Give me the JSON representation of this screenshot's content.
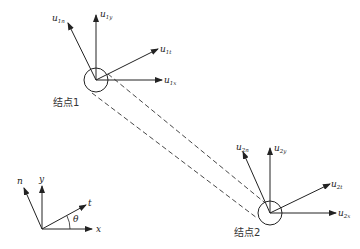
{
  "diagram": {
    "node1": {
      "label": "结点1",
      "vectors": {
        "n": {
          "base": "u",
          "sub": "1n"
        },
        "y": {
          "base": "u",
          "sub": "1y"
        },
        "t": {
          "base": "u",
          "sub": "1t"
        },
        "x": {
          "base": "u",
          "sub": "1x"
        }
      }
    },
    "node2": {
      "label": "结点2",
      "vectors": {
        "n": {
          "base": "u",
          "sub": "2n"
        },
        "y": {
          "base": "u",
          "sub": "2y"
        },
        "t": {
          "base": "u",
          "sub": "2t"
        },
        "x": {
          "base": "u",
          "sub": "2x"
        }
      }
    },
    "axes": {
      "x": "x",
      "y": "y",
      "t": "t",
      "n": "n",
      "angle": "θ"
    },
    "colors": {
      "stroke": "#222222",
      "text": "#222222"
    }
  }
}
